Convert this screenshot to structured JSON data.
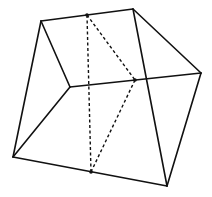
{
  "diagram": {
    "type": "geometric-solid",
    "vertices": {
      "A": [
        41,
        21
      ],
      "B": [
        133,
        9
      ],
      "C": [
        201,
        73
      ],
      "D": [
        167,
        186
      ],
      "E": [
        13,
        157
      ],
      "F": [
        70,
        87
      ]
    },
    "points": {
      "M1": [
        87,
        15
      ],
      "M2": [
        135,
        80
      ],
      "M3": [
        91,
        172
      ]
    },
    "solid_edges": [
      [
        "A",
        "B"
      ],
      [
        "B",
        "C"
      ],
      [
        "C",
        "D"
      ],
      [
        "D",
        "E"
      ],
      [
        "E",
        "A"
      ],
      [
        "A",
        "F"
      ],
      [
        "F",
        "E"
      ],
      [
        "F",
        "C"
      ],
      [
        "B",
        "D"
      ]
    ],
    "dashed_edges": [
      [
        "M1",
        "M3"
      ],
      [
        "M1",
        "M2"
      ],
      [
        "M2",
        "M3"
      ]
    ],
    "colors": {
      "line": "#111111",
      "background": "#ffffff"
    }
  }
}
